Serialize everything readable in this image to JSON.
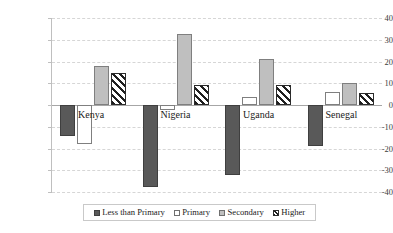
{
  "chart_data": {
    "type": "bar",
    "title": "",
    "subtitle": "",
    "xlabel": "",
    "ylabel": "",
    "categories": [
      "Kenya",
      "Nigeria",
      "Uganda",
      "Senegal"
    ],
    "series": [
      {
        "name": "Less than Primary",
        "values": [
          -14.3,
          -37.8,
          -32.2,
          -18.8
        ],
        "style": "solid-dark-gray",
        "color": "#595959"
      },
      {
        "name": "Primary",
        "values": [
          -17.8,
          -2.2,
          3.5,
          6.1
        ],
        "style": "solid-white",
        "color": "#ffffff"
      },
      {
        "name": "Secondary",
        "values": [
          18.0,
          32.6,
          21.2,
          10.1
        ],
        "style": "solid-light-gray",
        "color": "#bfbfbf"
      },
      {
        "name": "Higher",
        "values": [
          14.6,
          9.2,
          9.2,
          5.4
        ],
        "style": "diagonal-hatch",
        "color": "#1f1f1f"
      }
    ],
    "ylim": [
      -40,
      40
    ],
    "yticks": [
      40,
      30,
      20,
      10,
      0,
      -10,
      -20,
      -30,
      -40
    ],
    "ytick_labels": [
      "40",
      "30",
      "20",
      "10",
      "0",
      "-10",
      "-20",
      "-30",
      "-40"
    ],
    "grid": true,
    "grid_axis": "y",
    "legend_position": "bottom",
    "zero_line": true
  },
  "legend": {
    "items": [
      {
        "label": "Less than Primary"
      },
      {
        "label": "Primary"
      },
      {
        "label": "Secondary"
      },
      {
        "label": "Higher"
      }
    ]
  },
  "colors": {
    "less_than_primary": "#595959",
    "primary": "#ffffff",
    "secondary": "#bfbfbf",
    "higher": "#1f1f1f",
    "gridline": "#d6d6d6",
    "axis": "#a6a6a6",
    "text": "#1a1a1a",
    "background": "#ffffff"
  }
}
